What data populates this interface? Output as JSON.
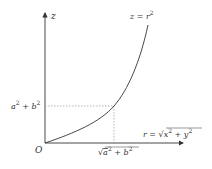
{
  "diagram": {
    "axes": {
      "vertical_label": "z",
      "horizontal_label": "r = √(x² + y²)",
      "origin_label": "O"
    },
    "curve": {
      "label": "z = r²",
      "equation": "z = r^2"
    },
    "markers": {
      "z_tick_label": "a² + b²",
      "r_tick_label": "√(a² + b²)"
    },
    "colors": {
      "axis": "#333333",
      "curve": "#333333",
      "guide": "#999999",
      "background": "#ffffff"
    }
  }
}
